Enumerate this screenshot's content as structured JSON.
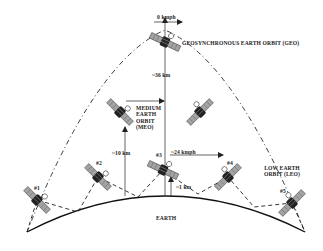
{
  "diagram": {
    "labels": {
      "geo_speed": "0 kmph",
      "geo_orbit": "GEOSYNCHRONOUS EARTH ORBIT (GEO)",
      "geo_altitude": "~36 km",
      "meo_orbit_line1": "MEDIUM",
      "meo_orbit_line2": "EARTH",
      "meo_orbit_line3": "ORBIT",
      "meo_orbit_line4": "(MEO)",
      "meo_altitude": "~10 km",
      "leo_speed": "~24 kmph",
      "leo_altitude": "~1 km",
      "leo_orbit_line1": "LOW EARTH",
      "leo_orbit_line2": "ORBIT (LEO)",
      "earth": "EARTH"
    },
    "satellites": [
      {
        "id": "geo",
        "label": "",
        "x": 165,
        "y": 42
      },
      {
        "id": "meo-left",
        "label": "",
        "x": 120,
        "y": 112
      },
      {
        "id": "meo-right",
        "label": "",
        "x": 200,
        "y": 112
      },
      {
        "id": "leo-1",
        "label": "#1",
        "x": 37,
        "y": 200
      },
      {
        "id": "leo-2",
        "label": "#2",
        "x": 98,
        "y": 177
      },
      {
        "id": "leo-3",
        "label": "#3",
        "x": 163,
        "y": 170
      },
      {
        "id": "leo-4",
        "label": "#4",
        "x": 228,
        "y": 177
      },
      {
        "id": "leo-5",
        "label": "#5",
        "x": 292,
        "y": 203
      }
    ],
    "colors": {
      "ink": "#222222",
      "panel": "#9a9a9a",
      "background": "#ffffff"
    }
  }
}
